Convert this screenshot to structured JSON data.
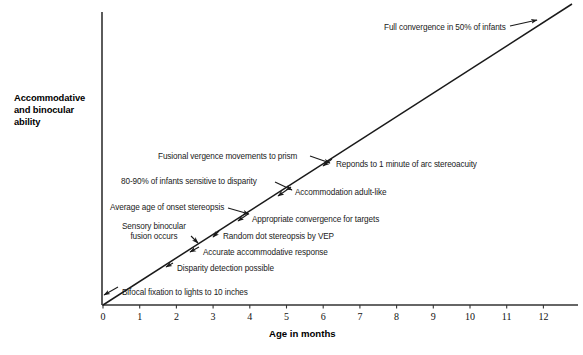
{
  "chart_data": {
    "type": "line",
    "title": "",
    "xlabel": "Age in months",
    "ylabel": "Accommodative and binocular ability",
    "ylabel_lines": [
      "Accommodative",
      "and binocular",
      "ability"
    ],
    "xlim": [
      0,
      12.7
    ],
    "ylim": [
      0,
      1
    ],
    "grid": false,
    "legend": "none",
    "x_ticks": [
      "0",
      "1",
      "2",
      "3",
      "4",
      "5",
      "6",
      "7",
      "8",
      "9",
      "10",
      "11",
      "12"
    ],
    "y_ticks": [],
    "series": [
      {
        "name": "Accommodative and binocular ability",
        "x": [
          0,
          12.7
        ],
        "values": [
          0,
          1
        ],
        "style": "straight-ascending-line"
      }
    ],
    "annotations": [
      {
        "id": "bifocal-fixation",
        "text": "Bifocal fixation to lights to 10 inches",
        "x_months": 0.5,
        "label_x": 122,
        "label_y": 288,
        "arrow_from_x": 118,
        "arrow_from_y": 287,
        "arrow_to_x": 104,
        "arrow_to_y": 295
      },
      {
        "id": "disparity-detection",
        "text": "Disparity detection possible",
        "x_months": 1.75,
        "label_x": 177,
        "label_y": 264,
        "arrow_from_x": 173,
        "arrow_from_y": 263,
        "arrow_to_x": 166,
        "arrow_to_y": 267
      },
      {
        "id": "accurate-accommodative",
        "text": "Accurate accommodative response",
        "x_months": 2.4,
        "label_x": 203,
        "label_y": 248,
        "arrow_from_x": 199,
        "arrow_from_y": 247,
        "arrow_to_x": 190,
        "arrow_to_y": 252
      },
      {
        "id": "random-dot-stereopsis",
        "text": "Random dot stereopsis by VEP",
        "x_months": 3.0,
        "label_x": 223,
        "label_y": 232,
        "arrow_from_x": 219,
        "arrow_from_y": 231,
        "arrow_to_x": 213,
        "arrow_to_y": 237
      },
      {
        "id": "sensory-binocular-fusion",
        "text": "Sensory binocular fusion occurs",
        "text_lines": [
          "Sensory binocular",
          "fusion occurs"
        ],
        "x_months": 2.6,
        "label_x": 122,
        "label_y": 222,
        "arrow_from_x": 191,
        "arrow_from_y": 236,
        "arrow_to_x": 198,
        "arrow_to_y": 243
      },
      {
        "id": "appropriate-convergence",
        "text": "Appropriate convergence for targets",
        "x_months": 3.55,
        "label_x": 252,
        "label_y": 215,
        "arrow_from_x": 248,
        "arrow_from_y": 214,
        "arrow_to_x": 238,
        "arrow_to_y": 221
      },
      {
        "id": "average-age-onset-stereopsis",
        "text": "Average age of onset stereopsis",
        "x_months": 3.9,
        "label_x": 110,
        "label_y": 203,
        "arrow_from_x": 228,
        "arrow_from_y": 208,
        "arrow_to_x": 249,
        "arrow_to_y": 214
      },
      {
        "id": "accommodation-adult-like",
        "text": "Accommodation adult-like",
        "x_months": 5.0,
        "label_x": 295,
        "label_y": 188,
        "arrow_from_x": 291,
        "arrow_from_y": 187,
        "arrow_to_x": 278,
        "arrow_to_y": 196
      },
      {
        "id": "infants-sensitive-disparity",
        "text": "80-90% of infants sensitive to disparity",
        "x_months": 4.6,
        "label_x": 121,
        "label_y": 177,
        "arrow_from_x": 275,
        "arrow_from_y": 182,
        "arrow_to_x": 292,
        "arrow_to_y": 190
      },
      {
        "id": "reponds-1-minute-arc",
        "text": "Reponds to 1 minute of arc stereoacuity",
        "x_months": 6.1,
        "label_x": 336,
        "label_y": 160,
        "arrow_from_x": 332,
        "arrow_from_y": 159,
        "arrow_to_x": 323,
        "arrow_to_y": 166
      },
      {
        "id": "fusional-vergence",
        "text": "Fusional vergence movements to prism",
        "x_months": 5.85,
        "label_x": 158,
        "label_y": 152,
        "arrow_from_x": 310,
        "arrow_from_y": 156,
        "arrow_to_x": 330,
        "arrow_to_y": 163
      },
      {
        "id": "full-convergence",
        "text": "Full convergence in 50% of infants",
        "x_months": 11.8,
        "label_x": 384,
        "label_y": 23,
        "arrow_from_x": 510,
        "arrow_from_y": 26,
        "arrow_to_x": 537,
        "arrow_to_y": 20
      }
    ]
  },
  "axes": {
    "x_axis_y": 305,
    "y_axis_x": 102,
    "x_origin_px": 103,
    "px_per_month": 36.7,
    "line_start": {
      "x": 103,
      "y": 305
    },
    "line_end": {
      "x": 572,
      "y": 4
    }
  },
  "colors": {
    "line": "#1a1a1a",
    "axis": "#333333",
    "text": "#111111",
    "background": "#ffffff"
  }
}
